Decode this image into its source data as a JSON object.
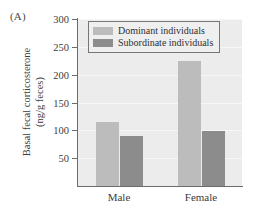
{
  "panel": {
    "label": "(A)"
  },
  "chart_data": {
    "type": "bar",
    "title": "",
    "xlabel": "",
    "ylabel_line1": "Basal fecal corticosterone",
    "ylabel_line2": "(ng/g feces)",
    "categories": [
      "Male",
      "Female"
    ],
    "series": [
      {
        "name": "Dominant individuals",
        "color": "#bcbcbc",
        "values": [
          115,
          225
        ]
      },
      {
        "name": "Subordinate individuals",
        "color": "#8c8c8c",
        "values": [
          90,
          98
        ]
      }
    ],
    "ylim": [
      0,
      300
    ],
    "yticks": [
      300,
      250,
      200,
      150,
      100,
      50
    ],
    "grid": true,
    "legend_position": "top-center",
    "plot_background": "#ececec"
  },
  "legend": {
    "items": [
      {
        "label": "Dominant individuals",
        "color": "#bcbcbc"
      },
      {
        "label": "Subordinate individuals",
        "color": "#8c8c8c"
      }
    ]
  }
}
